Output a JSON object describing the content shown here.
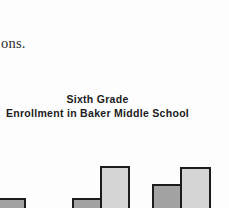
{
  "page": {
    "paragraph_fragment": "ons."
  },
  "chart": {
    "title_line1": "Sixth Grade",
    "title_line2": "Enrollment in Baker Middle School"
  },
  "colors": {
    "background": "#fdfdfd",
    "text": "#1b1b1b",
    "bar_border": "#1c1c1c",
    "dark_bar_fill": "#a3a3a3",
    "light_bar_fill": "#d5d5d5"
  },
  "chart_data": {
    "type": "bar",
    "title": "Sixth Grade Enrollment in Baker Middle School",
    "note": "Chart is cropped by the screenshot edges: axes, category labels and bar bottoms are not visible. Heights are visible pixel heights measured up from the bottom edge of the image.",
    "categories": [
      null,
      null,
      null
    ],
    "series": [
      {
        "name": "darker-bars",
        "visible_heights_px": [
          10,
          10,
          24
        ]
      },
      {
        "name": "lighter-bars",
        "visible_heights_px": [
          null,
          42,
          41
        ]
      }
    ],
    "legend": "none visible",
    "grid": false,
    "bars": [
      {
        "group": 1,
        "series": "dark",
        "left_px": -12,
        "width_px": 38,
        "top_px": 198
      },
      {
        "group": 2,
        "series": "dark",
        "left_px": 72,
        "width_px": 30,
        "top_px": 198
      },
      {
        "group": 2,
        "series": "light",
        "left_px": 100,
        "width_px": 30,
        "top_px": 166
      },
      {
        "group": 3,
        "series": "dark",
        "left_px": 152,
        "width_px": 30,
        "top_px": 184
      },
      {
        "group": 3,
        "series": "light",
        "left_px": 180,
        "width_px": 31,
        "top_px": 167
      }
    ]
  }
}
